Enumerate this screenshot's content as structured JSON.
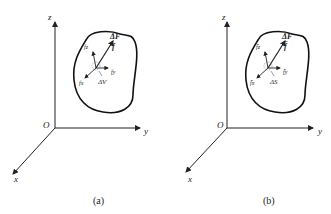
{
  "figure": {
    "panels": [
      {
        "id": "a",
        "caption": "(a)",
        "axes": {
          "origin": "O",
          "x": "x",
          "y": "y",
          "z": "z"
        },
        "vectors": {
          "delta_F": "ΔF",
          "f": "f",
          "fx": "fx",
          "fy": "fy",
          "fz": "fz"
        },
        "element_label": "ΔV",
        "description": "Body force on volume element ΔV"
      },
      {
        "id": "b",
        "caption": "(b)",
        "axes": {
          "origin": "O",
          "x": "x",
          "y": "y",
          "z": "z"
        },
        "vectors": {
          "delta_F": "ΔF",
          "f": "f̄",
          "fx": "f̄x",
          "fy": "f̄y",
          "fz": "f̄z"
        },
        "element_label": "ΔS",
        "description": "Surface force on surface element ΔS"
      }
    ]
  }
}
